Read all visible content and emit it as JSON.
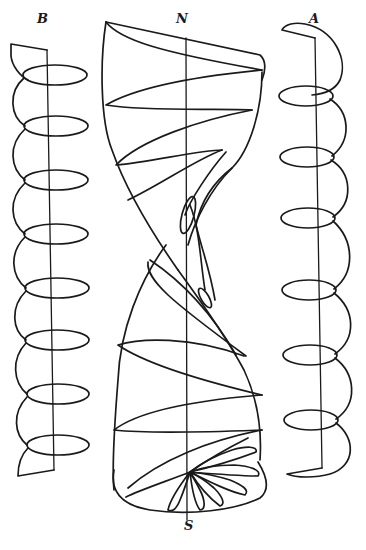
{
  "diagram": {
    "type": "line-art scientific illustration",
    "labels": {
      "left_helix": "B",
      "top_pole": "N",
      "right_helix": "A",
      "bottom_pole": "S"
    },
    "components": [
      {
        "name": "left-helix",
        "label": "B",
        "turns": 7,
        "axis": "vertical straight line"
      },
      {
        "name": "central-twisted-surface",
        "top_label": "N",
        "bottom_label": "S",
        "features": [
          "vertical axis",
          "spiral bands",
          "fan of petal loops at base"
        ]
      },
      {
        "name": "right-helix",
        "label": "A",
        "turns": 7,
        "axis": "vertical straight line"
      }
    ],
    "colors": {
      "ink": "#1a1a1a",
      "background": "#ffffff"
    }
  }
}
